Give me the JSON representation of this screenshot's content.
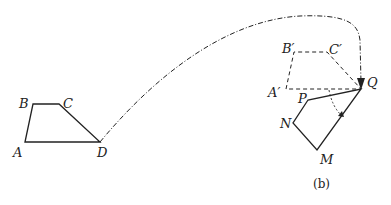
{
  "figure": {
    "caption": "(b)",
    "original_shape": {
      "labels": {
        "A": "A",
        "B": "B",
        "C": "C",
        "D": "D"
      },
      "points": {
        "A": [
          25,
          142
        ],
        "B": [
          33,
          104
        ],
        "C": [
          59,
          104
        ],
        "D": [
          100,
          142
        ]
      }
    },
    "translated_shape": {
      "labels": {
        "A": "A′",
        "B": "B′",
        "C": "C′",
        "Q": "Q"
      },
      "points": {
        "A": [
          286,
          89
        ],
        "B": [
          294,
          52
        ],
        "C": [
          327,
          52
        ],
        "Q": [
          361,
          89
        ]
      }
    },
    "rotated_shape": {
      "labels": {
        "P": "P",
        "N": "N",
        "M": "M"
      },
      "points": {
        "P": [
          308,
          100
        ],
        "N": [
          293,
          123
        ],
        "M": [
          317,
          150
        ],
        "Q": [
          361,
          89
        ]
      }
    },
    "colors": {
      "stroke": "#222222",
      "background": "#ffffff"
    }
  }
}
